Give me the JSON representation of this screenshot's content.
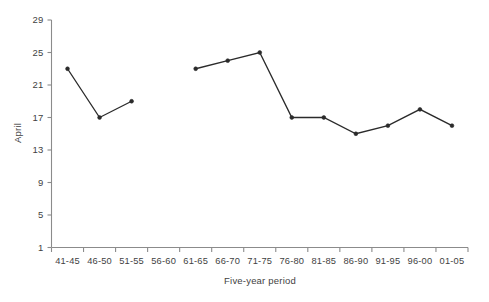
{
  "chart_data": {
    "type": "line",
    "title": "",
    "subtitle": "",
    "xlabel": "Five-year period",
    "ylabel": "April",
    "categories": [
      "41-45",
      "46-50",
      "51-55",
      "56-60",
      "61-65",
      "66-70",
      "71-75",
      "76-80",
      "81-85",
      "86-90",
      "91-95",
      "96-00",
      "01-05"
    ],
    "values": [
      23,
      17,
      19,
      null,
      23,
      24,
      25,
      17,
      17,
      15,
      16,
      18,
      16
    ],
    "series": [
      {
        "name": "April",
        "values": [
          23,
          17,
          19,
          null,
          23,
          24,
          25,
          17,
          17,
          15,
          16,
          18,
          16
        ]
      }
    ],
    "yticks": [
      1,
      5,
      9,
      13,
      17,
      21,
      25,
      29
    ],
    "ylim": [
      1,
      29
    ],
    "grid": false,
    "legend": false,
    "legend_position": "none",
    "marker": "filled-circle",
    "line_color": "#2b2b2b",
    "axis_color": "#8b8b8b",
    "background_color": "#ffffff",
    "annotations": []
  },
  "axes": {
    "y_title": "April",
    "x_title": "Five-year period",
    "y_tick_labels": [
      "1",
      "5",
      "9",
      "13",
      "17",
      "21",
      "25",
      "29"
    ],
    "x_tick_labels": [
      "41-45",
      "46-50",
      "51-55",
      "56-60",
      "61-65",
      "66-70",
      "71-75",
      "76-80",
      "81-85",
      "86-90",
      "91-95",
      "96-00",
      "01-05"
    ]
  }
}
